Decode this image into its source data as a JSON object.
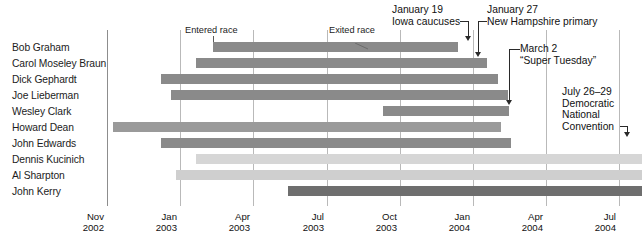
{
  "chart_data": {
    "type": "bar",
    "orientation": "horizontal-timeline",
    "title": "",
    "xlabel": "",
    "ylabel": "",
    "grid": true,
    "legend_position": "top-inline",
    "x_axis": {
      "ticks": [
        {
          "month": "Nov",
          "year": "2002",
          "x": 107
        },
        {
          "month": "Jan",
          "year": "2003",
          "x": 180
        },
        {
          "month": "Apr",
          "year": "2003",
          "x": 253
        },
        {
          "month": "Jul",
          "year": "2003",
          "x": 327
        },
        {
          "month": "Oct",
          "year": "2003",
          "x": 400
        },
        {
          "month": "Jan",
          "year": "2004",
          "x": 473
        },
        {
          "month": "Apr",
          "year": "2004",
          "x": 546
        },
        {
          "month": "Jul",
          "year": "2004",
          "x": 619
        }
      ],
      "range_start": "Nov 2002",
      "range_end": "Jul 2004"
    },
    "categories": [
      "Bob Graham",
      "Carol Moseley Braun",
      "Dick Gephardt",
      "Joe Lieberman",
      "Wesley Clark",
      "Howard Dean",
      "John Edwards",
      "Dennis Kucinich",
      "Al Sharpton",
      "John Kerry"
    ],
    "bars": [
      {
        "label": "Bob Graham",
        "entered": "Mar 2003",
        "exited": "Oct 2003",
        "x": 213,
        "w": 245,
        "y": 42,
        "color": "#8a8a8a"
      },
      {
        "label": "Carol Moseley Braun",
        "entered": "Feb 2003",
        "exited": "Jan 2004",
        "x": 196,
        "w": 291,
        "y": 58,
        "color": "#8a8a8a"
      },
      {
        "label": "Dick Gephardt",
        "entered": "Jan 2003",
        "exited": "Jan 2004",
        "x": 161,
        "w": 337,
        "y": 74,
        "color": "#8a8a8a"
      },
      {
        "label": "Joe Lieberman",
        "entered": "Jan 2003",
        "exited": "Feb 2004",
        "x": 171,
        "w": 337,
        "y": 90,
        "color": "#8a8a8a"
      },
      {
        "label": "Wesley Clark",
        "entered": "Sep 2003",
        "exited": "Feb 2004",
        "x": 383,
        "w": 126,
        "y": 106,
        "color": "#8a8a8a"
      },
      {
        "label": "Howard Dean",
        "entered": "Nov 2002",
        "exited": "Feb 2004",
        "x": 113,
        "w": 388,
        "y": 122,
        "color": "#9a9a9a"
      },
      {
        "label": "John Edwards",
        "entered": "Jan 2003",
        "exited": "Mar 2004",
        "x": 161,
        "w": 350,
        "y": 138,
        "color": "#8a8a8a"
      },
      {
        "label": "Dennis Kucinich",
        "entered": "Feb 2003",
        "exited": "ongoing",
        "x": 196,
        "w": 446,
        "y": 154,
        "color": "#d6d6d6"
      },
      {
        "label": "Al Sharpton",
        "entered": "Jan 2003",
        "exited": "ongoing",
        "x": 176,
        "w": 466,
        "y": 170,
        "color": "#cfcfcf"
      },
      {
        "label": "John Kerry",
        "entered": "Jul 2003",
        "exited": "ongoing",
        "x": 288,
        "w": 354,
        "y": 186,
        "color": "#6e6e6e"
      }
    ],
    "annotations": [
      {
        "name": "entered-race",
        "text": "Entered race",
        "x": 185,
        "y": 26
      },
      {
        "name": "exited-race",
        "text": "Exited race",
        "x": 329,
        "y": 26
      },
      {
        "name": "iowa-caucuses",
        "line1": "January 19",
        "line2": "Iowa caucuses",
        "x": 392,
        "y": 6,
        "arrow_x": 468,
        "arrow_y": 42
      },
      {
        "name": "nh-primary",
        "line1": "January 27",
        "line2": "New Hampshire primary",
        "x": 487,
        "y": 6,
        "arrow_x": 478,
        "arrow_y": 58
      },
      {
        "name": "super-tuesday",
        "line1": "March 2",
        "line2": "“Super Tuesday”",
        "x": 527,
        "y": 45,
        "arrow_x": 508,
        "arrow_y": 106
      },
      {
        "name": "dnc-convention",
        "line1": "July 26–29",
        "line2": "Democratic",
        "line3": "National",
        "line4": "Convention",
        "x": 562,
        "y": 88,
        "arrow_x": 626,
        "arrow_y": 138
      }
    ]
  },
  "figure": {
    "width": 642,
    "height": 250,
    "background": "#ffffff",
    "gridline_color": "#b9b9b9",
    "axis_color": "#8d8d8d",
    "text_color": "#1c1c1c",
    "bar_default_color": "#8a8a8a",
    "bar_light_color": "#d6d6d6",
    "bar_dark_color": "#6e6e6e"
  }
}
